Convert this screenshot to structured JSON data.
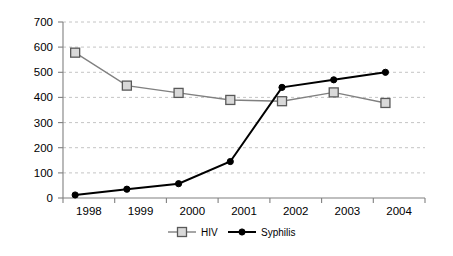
{
  "chart_data": {
    "type": "line",
    "title": "",
    "subtitle": "",
    "xlabel": "",
    "ylabel": "",
    "categories": [
      "1998",
      "1999",
      "2000",
      "2001",
      "2002",
      "2003",
      "2004"
    ],
    "series": [
      {
        "name": "HIV",
        "marker": "square",
        "color": "#808080",
        "marker_fill": "#d9d9d9",
        "values": [
          578,
          447,
          418,
          390,
          385,
          420,
          378
        ]
      },
      {
        "name": "Syphilis",
        "marker": "circle",
        "color": "#000000",
        "marker_fill": "#000000",
        "values": [
          12,
          35,
          57,
          145,
          440,
          470,
          500
        ]
      }
    ],
    "ylim": [
      0,
      700
    ],
    "y_ticks": [
      0,
      100,
      200,
      300,
      400,
      500,
      600,
      700
    ],
    "y_tick_labels": [
      "0",
      "100",
      "200",
      "300",
      "400",
      "500",
      "600",
      "700"
    ],
    "grid": true,
    "grid_axis": "y",
    "legend_position": "bottom",
    "legend_entries": [
      "HIV",
      "Syphilis"
    ]
  },
  "legend": {
    "hiv_label": "HIV",
    "syphilis_label": "Syphilis"
  },
  "axis": {
    "y_labels": [
      "700",
      "600",
      "500",
      "400",
      "300",
      "200",
      "100",
      "0"
    ],
    "x_labels": [
      "1998",
      "1999",
      "2000",
      "2001",
      "2002",
      "2003",
      "2004"
    ]
  }
}
